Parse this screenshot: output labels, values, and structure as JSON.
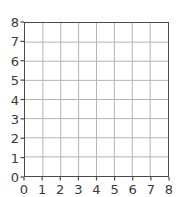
{
  "chart_data": {
    "type": "line",
    "title": "",
    "subtitle": "",
    "xlabel": "",
    "ylabel": "",
    "x": [],
    "values": [],
    "series": [],
    "xlim": [
      0,
      8
    ],
    "ylim": [
      0,
      8
    ],
    "xticks": [
      "0",
      "1",
      "2",
      "3",
      "4",
      "5",
      "6",
      "7",
      "8"
    ],
    "yticks": [
      "0",
      "1",
      "2",
      "3",
      "4",
      "5",
      "6",
      "7",
      "8"
    ],
    "xtick_values": [
      0,
      1,
      2,
      3,
      4,
      5,
      6,
      7,
      8
    ],
    "ytick_values": [
      0,
      1,
      2,
      3,
      4,
      5,
      6,
      7,
      8
    ],
    "grid": true,
    "grid_divisions_x": 8,
    "grid_divisions_y": 8,
    "legend": [],
    "legend_position": "none",
    "annotations": [],
    "note": "Empty 8x8 coordinate grid with no plotted data"
  },
  "style": {
    "background_color": "#ffffff",
    "frame_color": "#4a4a4a",
    "grid_color": "#b4b4b4",
    "tick_color": "#4a4a4a",
    "label_color": "#3a3a3a"
  }
}
